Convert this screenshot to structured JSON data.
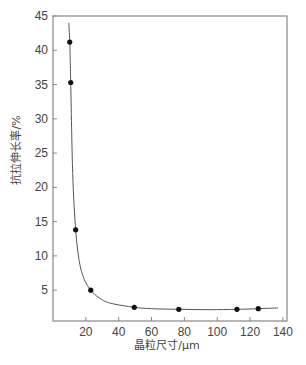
{
  "chart_data": {
    "type": "line",
    "title": "",
    "xlabel": "晶粒尺寸/μm",
    "ylabel": "抗拉伸长率/%",
    "xlim": [
      0,
      140
    ],
    "ylim": [
      0.5,
      45
    ],
    "xticks": [
      20,
      40,
      60,
      80,
      100,
      120,
      140
    ],
    "yticks": [
      5,
      10,
      15,
      20,
      25,
      30,
      35,
      40,
      45
    ],
    "grid": false,
    "legend": null,
    "series": [
      {
        "name": "measured",
        "style": "markers",
        "x": [
          10.2,
          10.8,
          13.8,
          23,
          49.5,
          76.6,
          112,
          125
        ],
        "y": [
          41.2,
          35.3,
          13.8,
          5.0,
          2.5,
          2.2,
          2.2,
          2.3
        ]
      },
      {
        "name": "fit",
        "style": "line",
        "x": [
          9.6,
          10.2,
          10.8,
          12,
          13.8,
          16,
          19,
          23,
          28,
          35,
          49.5,
          60,
          76.6,
          95,
          112,
          125,
          137
        ],
        "y": [
          44,
          41.2,
          35.3,
          22,
          13.8,
          9.2,
          6.6,
          5.0,
          3.9,
          3.1,
          2.5,
          2.3,
          2.2,
          2.15,
          2.2,
          2.3,
          2.4
        ]
      }
    ]
  },
  "colors": {
    "axis": "#888888",
    "line": "#555555",
    "marker": "#111111",
    "text": "#444444"
  }
}
